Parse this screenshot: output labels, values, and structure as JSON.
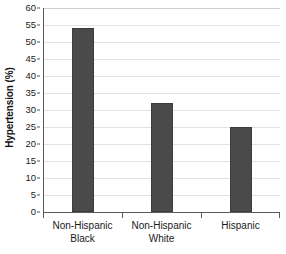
{
  "chart_data": {
    "type": "bar",
    "title": "",
    "xlabel": "",
    "ylabel": "Hypertension (%)",
    "categories": [
      "Non-Hispanic Black",
      "Non-Hispanic White",
      "Hispanic"
    ],
    "category_lines": [
      [
        "Non-Hispanic",
        "Black"
      ],
      [
        "Non-Hispanic",
        "White"
      ],
      [
        "Hispanic",
        ""
      ]
    ],
    "values": [
      54,
      32,
      25
    ],
    "ylim": [
      0,
      60
    ],
    "ytick_step": 5,
    "yticks": [
      0,
      5,
      10,
      15,
      20,
      25,
      30,
      35,
      40,
      45,
      50,
      55,
      60
    ],
    "ytick_labels": [
      "0",
      "5",
      "10",
      "15",
      "20",
      "25",
      "30",
      "35",
      "40",
      "45",
      "50",
      "55",
      "60"
    ],
    "grid": true,
    "grid_axis": "y",
    "legend": false,
    "legend_position": "none",
    "bar_color": "#4a4a4a",
    "bar_edge_color": "#3c3c3c",
    "gridline_color": "#e2e2e2",
    "axis_color": "#5a5a5a",
    "background_color": "#ffffff"
  }
}
